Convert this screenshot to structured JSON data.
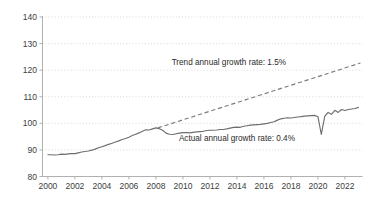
{
  "chart_data": {
    "type": "line",
    "title": "",
    "subtitle": "",
    "xlabel": "",
    "ylabel": "",
    "xlim": [
      1999.6,
      2023.3
    ],
    "ylim": [
      80,
      140
    ],
    "grid": true,
    "grid_axis": "y",
    "legend": "none",
    "y_ticks": [
      80,
      90,
      100,
      110,
      120,
      130,
      140
    ],
    "y_tick_labels": [
      "80",
      "90",
      "100",
      "110",
      "120",
      "130",
      "140"
    ],
    "x_ticks": [
      2000,
      2002,
      2004,
      2006,
      2008,
      2010,
      2012,
      2014,
      2016,
      2018,
      2020,
      2022
    ],
    "x_tick_labels": [
      "2000",
      "2002",
      "2004",
      "2006",
      "2008",
      "2010",
      "2012",
      "2014",
      "2016",
      "2018",
      "2020",
      "2022"
    ],
    "colors": {
      "actual_line": "#6e6e6e",
      "trend_line": "#7a7a7a",
      "gridline": "#c8c8c8",
      "axis": "#a8a8a8",
      "text": "#3d3d3d",
      "background": "#ffffff"
    },
    "annotations": [
      {
        "name": "trend-growth-annotation",
        "text": "Trend annual growth rate: 1.5%",
        "x": 2013.4,
        "y": 122.0
      },
      {
        "name": "actual-growth-annotation",
        "text": "Actual annual growth rate: 0.4%",
        "x": 2014.0,
        "y": 93.3
      }
    ],
    "series": [
      {
        "name": "Actual",
        "style": "solid",
        "x": [
          2000.0,
          2000.25,
          2000.5,
          2000.75,
          2001.0,
          2001.25,
          2001.5,
          2001.75,
          2002.0,
          2002.25,
          2002.5,
          2002.75,
          2003.0,
          2003.25,
          2003.5,
          2003.75,
          2004.0,
          2004.25,
          2004.5,
          2004.75,
          2005.0,
          2005.25,
          2005.5,
          2005.75,
          2006.0,
          2006.25,
          2006.5,
          2006.75,
          2007.0,
          2007.25,
          2007.5,
          2007.75,
          2008.0,
          2008.25,
          2008.5,
          2008.75,
          2009.0,
          2009.25,
          2009.5,
          2009.75,
          2010.0,
          2010.25,
          2010.5,
          2010.75,
          2011.0,
          2011.25,
          2011.5,
          2011.75,
          2012.0,
          2012.25,
          2012.5,
          2012.75,
          2013.0,
          2013.25,
          2013.5,
          2013.75,
          2014.0,
          2014.25,
          2014.5,
          2014.75,
          2015.0,
          2015.25,
          2015.5,
          2015.75,
          2016.0,
          2016.25,
          2016.5,
          2016.75,
          2017.0,
          2017.25,
          2017.5,
          2017.75,
          2018.0,
          2018.25,
          2018.5,
          2018.75,
          2019.0,
          2019.25,
          2019.5,
          2019.75,
          2020.0,
          2020.25,
          2020.5,
          2020.75,
          2021.0,
          2021.25,
          2021.5,
          2021.75,
          2022.0,
          2022.25,
          2022.5,
          2022.75,
          2023.0
        ],
        "values": [
          88.2,
          88.2,
          88.1,
          88.2,
          88.4,
          88.3,
          88.5,
          88.6,
          88.6,
          88.9,
          89.2,
          89.4,
          89.6,
          89.9,
          90.3,
          90.8,
          91.2,
          91.6,
          92.1,
          92.5,
          93.0,
          93.4,
          93.9,
          94.3,
          94.8,
          95.4,
          95.9,
          96.4,
          97.0,
          97.6,
          97.5,
          97.9,
          98.3,
          98.0,
          97.4,
          96.3,
          95.9,
          95.8,
          96.1,
          96.3,
          96.5,
          96.5,
          96.4,
          96.6,
          96.8,
          96.9,
          97.0,
          97.3,
          97.4,
          97.4,
          97.5,
          97.7,
          97.7,
          97.9,
          98.2,
          98.5,
          98.6,
          98.5,
          98.9,
          99.1,
          99.3,
          99.4,
          99.5,
          99.6,
          99.8,
          100.0,
          100.3,
          100.6,
          101.2,
          101.7,
          101.9,
          102.1,
          102.0,
          102.2,
          102.4,
          102.5,
          102.7,
          102.8,
          102.9,
          103.0,
          102.5,
          95.8,
          102.6,
          104.1,
          103.4,
          104.9,
          104.1,
          105.2,
          104.8,
          105.2,
          105.4,
          105.6,
          106.0
        ]
      },
      {
        "name": "Trend",
        "style": "dashed",
        "x": [
          2008.15,
          2023.15
        ],
        "values": [
          98.3,
          122.7
        ]
      }
    ]
  }
}
